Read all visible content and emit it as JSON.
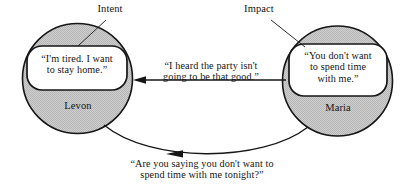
{
  "diagram": {
    "colors": {
      "circle_fill": "#c9c9c9",
      "circle_stroke": "#161616",
      "bubble_fill": "#ffffff",
      "bubble_stroke": "#161616",
      "line": "#161616",
      "text": "#141414",
      "background": "#ffffff"
    },
    "annotations": [
      {
        "id": "intent",
        "label": "Intent"
      },
      {
        "id": "impact",
        "label": "Impact"
      }
    ],
    "nodes": [
      {
        "id": "levon",
        "name": "Levon",
        "thought": "“I'm tired. I want\nto stay home.”"
      },
      {
        "id": "maria",
        "name": "Maria",
        "thought": "“You don't want\nto spend time\nwith me.”"
      }
    ],
    "edges": [
      {
        "id": "levon-to-maria",
        "from": "levon",
        "to": "maria",
        "shape": "straight",
        "arrow_at": "left",
        "text": "“I heard the party isn't\ngoing to be that good.”"
      },
      {
        "id": "maria-to-levon",
        "from": "maria",
        "to": "levon",
        "shape": "curved",
        "arrow_at": "middle-left",
        "text": "“Are you saying you don't want to\nspend time with me tonight?”"
      }
    ]
  }
}
